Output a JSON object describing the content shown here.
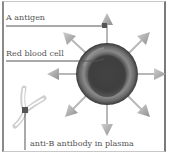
{
  "diagram": {
    "labels": {
      "antigen": "A antigen",
      "cell": "Red blood cell",
      "antibody": "anti-B antibody in plasma"
    },
    "colors": {
      "cell_dark": "#3a3a3a",
      "cell_light": "#8c8c8c",
      "arrow": "#a8a8a8",
      "arrow_shaft": "#b5b5b5",
      "antibody": "#d2d2d2",
      "marker": "#555555",
      "leader_line": "#555555",
      "text": "#555555",
      "background": "#ffffff"
    },
    "elements": [
      {
        "name": "red-blood-cell",
        "shape": "circle"
      },
      {
        "name": "a-antigen",
        "count": 8,
        "shape": "arrow"
      },
      {
        "name": "anti-b-antibody",
        "shape": "y-shape"
      }
    ]
  }
}
